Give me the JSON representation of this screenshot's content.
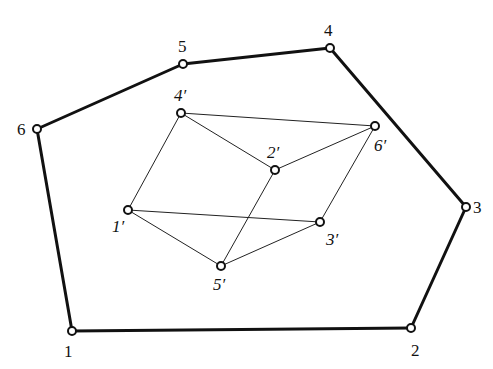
{
  "diagram": {
    "type": "graph",
    "outer": {
      "vertices": [
        {
          "id": "1",
          "label": "1",
          "x": 72,
          "y": 331,
          "lx": 64,
          "ly": 357
        },
        {
          "id": "2",
          "label": "2",
          "x": 411,
          "y": 328,
          "lx": 411,
          "ly": 356
        },
        {
          "id": "3",
          "label": "3",
          "x": 466,
          "y": 207,
          "lx": 473,
          "ly": 213
        },
        {
          "id": "4",
          "label": "4",
          "x": 330,
          "y": 48,
          "lx": 324,
          "ly": 36
        },
        {
          "id": "5",
          "label": "5",
          "x": 183,
          "y": 64,
          "lx": 178,
          "ly": 52
        },
        {
          "id": "6",
          "label": "6",
          "x": 37,
          "y": 129,
          "lx": 17,
          "ly": 135
        }
      ],
      "edges": [
        [
          "1",
          "2"
        ],
        [
          "2",
          "3"
        ],
        [
          "3",
          "4"
        ],
        [
          "4",
          "5"
        ],
        [
          "5",
          "6"
        ],
        [
          "6",
          "1"
        ]
      ]
    },
    "inner": {
      "vertices": [
        {
          "id": "1p",
          "label": "1′",
          "x": 128,
          "y": 210,
          "lx": 112,
          "ly": 232
        },
        {
          "id": "2p",
          "label": "2′",
          "x": 275,
          "y": 170,
          "lx": 267,
          "ly": 158
        },
        {
          "id": "3p",
          "label": "3′",
          "x": 320,
          "y": 222,
          "lx": 326,
          "ly": 245
        },
        {
          "id": "4p",
          "label": "4′",
          "x": 181,
          "y": 113,
          "lx": 174,
          "ly": 101
        },
        {
          "id": "5p",
          "label": "5′",
          "x": 221,
          "y": 266,
          "lx": 213,
          "ly": 290
        },
        {
          "id": "6p",
          "label": "6′",
          "x": 375,
          "y": 126,
          "lx": 374,
          "ly": 151
        }
      ],
      "edges": [
        [
          "4p",
          "6p"
        ],
        [
          "4p",
          "2p"
        ],
        [
          "4p",
          "1p"
        ],
        [
          "2p",
          "6p"
        ],
        [
          "2p",
          "5p"
        ],
        [
          "6p",
          "3p"
        ],
        [
          "1p",
          "3p"
        ],
        [
          "1p",
          "5p"
        ],
        [
          "5p",
          "3p"
        ]
      ]
    },
    "colors": {
      "stroke": "#111111",
      "vertex_fill": "#ffffff",
      "background": "#ffffff"
    }
  }
}
